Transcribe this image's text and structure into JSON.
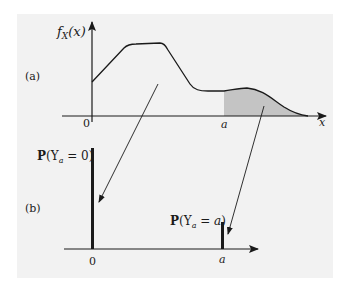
{
  "figure": {
    "background": "#f2f2f2",
    "shade_color": "#c4c4c4",
    "ink_color": "#1a1a1a",
    "panel_a": {
      "label": "(a)",
      "y_axis_label_f": "f",
      "y_axis_label_sub": "X",
      "y_axis_label_arg": "(x)",
      "x_axis_label": "x",
      "tick_zero": "0",
      "tick_a": "a"
    },
    "panel_b": {
      "label": "(b)",
      "bar0_label_P": "P",
      "bar0_label_open": "(Y",
      "bar0_label_sub": "a",
      "bar0_label_rest": " = 0)",
      "bara_label_P": "P",
      "bara_label_open": "(Y",
      "bara_label_sub": "a",
      "bara_label_eq": " = ",
      "bara_label_val": "a",
      "bara_label_close": ")",
      "tick_zero": "0",
      "tick_a": "a"
    }
  }
}
